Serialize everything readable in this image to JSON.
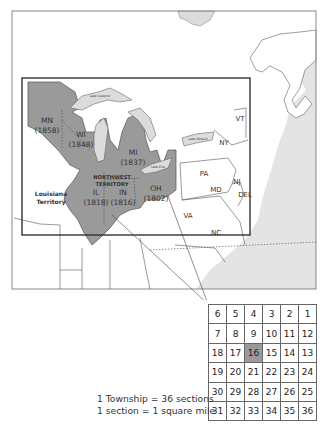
{
  "map": {
    "states": [
      {
        "abbr": "MN",
        "year": "(1858)"
      },
      {
        "abbr": "WI",
        "year": "(1848)"
      },
      {
        "abbr": "MI",
        "year": "(1837)"
      },
      {
        "abbr": "IL",
        "year": "(1818)"
      },
      {
        "abbr": "IN",
        "year": "(1816)"
      },
      {
        "abbr": "OH",
        "year": "(1802)"
      }
    ],
    "region_label_line1": "NORTHWEST",
    "region_label_line2": "TERRITORY",
    "louisiana_line1": "Louisiana",
    "louisiana_line2": "Territory",
    "other_states": [
      "NY",
      "VT",
      "PA",
      "NJ",
      "MD",
      "DEL",
      "VA",
      "NC"
    ],
    "lakes": [
      "Lake Superior",
      "Lake Michigan",
      "Lake Huron",
      "Lake Erie",
      "Lake Ontario"
    ],
    "colors": {
      "territory": "#9a9a9a",
      "water": "#dcdcdc",
      "land": "#ffffff",
      "border": "#555555"
    }
  },
  "township": {
    "rows": [
      [
        "6",
        "5",
        "4",
        "3",
        "2",
        "1"
      ],
      [
        "7",
        "8",
        "9",
        "10",
        "11",
        "12"
      ],
      [
        "18",
        "17",
        "16",
        "15",
        "14",
        "13"
      ],
      [
        "19",
        "20",
        "21",
        "22",
        "23",
        "24"
      ],
      [
        "30",
        "29",
        "28",
        "27",
        "26",
        "25"
      ],
      [
        "31",
        "32",
        "33",
        "34",
        "35",
        "36"
      ]
    ],
    "highlighted": "16",
    "caption_line1": "1 Township = 36 sections",
    "caption_line2": "1 section = 1 square mile"
  }
}
